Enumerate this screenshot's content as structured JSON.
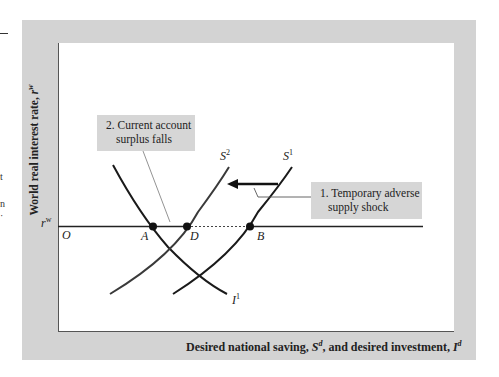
{
  "figure": {
    "y_axis_label": "World real interest rate, ",
    "y_axis_var": "r",
    "y_axis_var_sup": "w",
    "x_axis_label_part1": "Desired national saving, ",
    "x_axis_var1": "S",
    "x_axis_var1_sup": "d",
    "x_axis_label_part2": ", and desired investment, ",
    "x_axis_var2": "I",
    "x_axis_var2_sup": "d",
    "origin_label": "O",
    "rate_tick_label": "r",
    "rate_tick_sup": "w"
  },
  "curves": {
    "s1": {
      "name": "S",
      "sup": "1"
    },
    "s2": {
      "name": "S",
      "sup": "2"
    },
    "i1": {
      "name": "I",
      "sup": "1"
    }
  },
  "points": {
    "a": "A",
    "d": "D",
    "b": "B"
  },
  "callouts": {
    "shock": {
      "line1": "1. Temporary adverse",
      "line2": "supply shock"
    },
    "surplus": {
      "line1": "2. Current account",
      "line2": "surplus falls"
    }
  },
  "edge_fragments": [
    "t",
    "n",
    "·"
  ],
  "colors": {
    "panel": "#d3d3d3",
    "plot_bg": "#ffffff",
    "callout_bg": "#d6d6d6",
    "curve": "#1a1a1a"
  }
}
